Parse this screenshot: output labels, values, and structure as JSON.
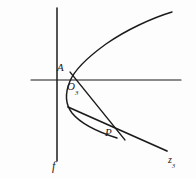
{
  "figure": {
    "background_color": "#fdfdfd",
    "ink_color": "#1b1b1b",
    "width": 196,
    "height": 179,
    "labels": {
      "point_a": "A",
      "origin_letter": "O",
      "origin_subscript": "3",
      "point_p": "P",
      "directrix": "f",
      "axis_letter": "z",
      "axis_subscript": "3"
    },
    "geometry": {
      "horizontal_axis": {
        "x1": 31,
        "y1": 80,
        "x2": 181,
        "y2": 80
      },
      "directrix": {
        "x1": 57,
        "y1": 8,
        "x2": 57,
        "y2": 161
      },
      "curve_path": "M 172 12 C 150 19, 120 33, 100 49 C 84 61, 74 71, 69 83 C 64 95, 64 105, 71 114 C 80 125, 98 133, 116 137",
      "chord_path": "M 70 72 L 124 139",
      "tangent_path": "M 68 107 L 166 151",
      "point_a_xy": [
        71,
        72
      ],
      "point_o3_xy": [
        73,
        81
      ],
      "point_p_xy": [
        115,
        131
      ]
    }
  }
}
